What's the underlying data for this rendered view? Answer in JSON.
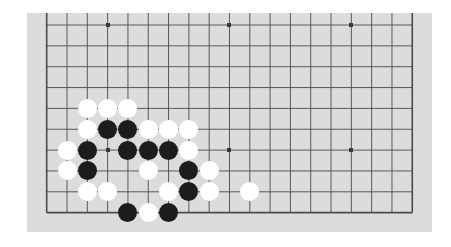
{
  "board": {
    "size": 19,
    "visible_columns": 19,
    "visible_rows": 10,
    "visible_row_range": [
      9,
      18
    ],
    "background_color": "#dcdcdc",
    "line_color": "#4a4a4a",
    "page_background": "#ffffff",
    "star_points": [
      {
        "col": 3,
        "row": 9
      },
      {
        "col": 9,
        "row": 9
      },
      {
        "col": 15,
        "row": 9
      },
      {
        "col": 3,
        "row": 15
      },
      {
        "col": 9,
        "row": 15
      },
      {
        "col": 15,
        "row": 15
      }
    ],
    "stones": [
      {
        "col": 2,
        "row": 13,
        "color": "white"
      },
      {
        "col": 3,
        "row": 13,
        "color": "white"
      },
      {
        "col": 4,
        "row": 13,
        "color": "white"
      },
      {
        "col": 2,
        "row": 14,
        "color": "white"
      },
      {
        "col": 3,
        "row": 14,
        "color": "black"
      },
      {
        "col": 4,
        "row": 14,
        "color": "black"
      },
      {
        "col": 5,
        "row": 14,
        "color": "white"
      },
      {
        "col": 6,
        "row": 14,
        "color": "white"
      },
      {
        "col": 7,
        "row": 14,
        "color": "white"
      },
      {
        "col": 1,
        "row": 15,
        "color": "white"
      },
      {
        "col": 2,
        "row": 15,
        "color": "black"
      },
      {
        "col": 4,
        "row": 15,
        "color": "black"
      },
      {
        "col": 5,
        "row": 15,
        "color": "black"
      },
      {
        "col": 6,
        "row": 15,
        "color": "black"
      },
      {
        "col": 7,
        "row": 15,
        "color": "white"
      },
      {
        "col": 1,
        "row": 16,
        "color": "white"
      },
      {
        "col": 2,
        "row": 16,
        "color": "black"
      },
      {
        "col": 5,
        "row": 16,
        "color": "white"
      },
      {
        "col": 7,
        "row": 16,
        "color": "black"
      },
      {
        "col": 8,
        "row": 16,
        "color": "white"
      },
      {
        "col": 2,
        "row": 17,
        "color": "white"
      },
      {
        "col": 3,
        "row": 17,
        "color": "white"
      },
      {
        "col": 6,
        "row": 17,
        "color": "white"
      },
      {
        "col": 7,
        "row": 17,
        "color": "black"
      },
      {
        "col": 8,
        "row": 17,
        "color": "white"
      },
      {
        "col": 10,
        "row": 17,
        "color": "white"
      },
      {
        "col": 4,
        "row": 18,
        "color": "black"
      },
      {
        "col": 5,
        "row": 18,
        "color": "white"
      },
      {
        "col": 6,
        "row": 18,
        "color": "black"
      }
    ],
    "counts": {
      "black": 12,
      "white": 17
    }
  }
}
